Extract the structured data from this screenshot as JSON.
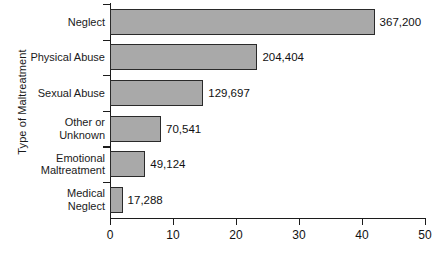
{
  "chart_data": {
    "type": "bar",
    "orientation": "horizontal",
    "title": "",
    "ylabel": "Type of Maltreatment",
    "xlabel": "",
    "categories": [
      "Neglect",
      "Physical Abuse",
      "Sexual Abuse",
      "Other or Unknown",
      "Emotional Maltreatment",
      "Medical Neglect"
    ],
    "category_lines": [
      [
        "Neglect"
      ],
      [
        "Physical Abuse"
      ],
      [
        "Sexual Abuse"
      ],
      [
        "Other or",
        "Unknown"
      ],
      [
        "Emotional",
        "Maltreatment"
      ],
      [
        "Medical",
        "Neglect"
      ]
    ],
    "values": [
      367200,
      204404,
      129697,
      70541,
      49124,
      17288
    ],
    "value_labels": [
      "367,200",
      "204,404",
      "129,697",
      "70,541",
      "49,124",
      "17,288"
    ],
    "axis_values": [
      42.0,
      23.4,
      14.8,
      8.1,
      5.6,
      2.0
    ],
    "xticks": [
      0,
      10,
      20,
      30,
      40,
      50
    ],
    "xtick_labels": [
      "0",
      "10",
      "20",
      "30",
      "40",
      "50"
    ],
    "xlim": [
      0,
      50
    ],
    "grid": false,
    "legend": null,
    "bar_color": "#a9a9a9",
    "bar_edge_color": "#2a2a2a",
    "axis_color": "#1c1c1c"
  }
}
